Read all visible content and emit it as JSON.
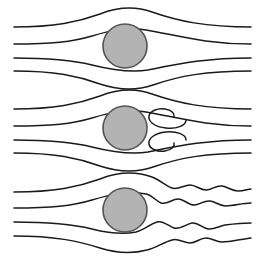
{
  "figure": {
    "background_color": "#ffffff",
    "width": 265,
    "height": 256
  },
  "style": {
    "streamline_color": "#1a1a1a",
    "streamline_width": 1.5,
    "cylinder_fill": "#b3b3b3",
    "cylinder_stroke": "#545454",
    "cylinder_stroke_width": 1.6
  },
  "panels": [
    {
      "id": "panel-laminar",
      "name": "laminar-attached-flow",
      "caption": "",
      "index": 1,
      "y_offset": 0,
      "cylinder": {
        "cx": 125,
        "cy": 46,
        "r": 22
      },
      "streamline_count": 4,
      "inlet_y": [
        27,
        44,
        58,
        71
      ],
      "outlet_y": [
        27,
        44,
        58,
        71
      ],
      "wake": "attached-symmetric",
      "paths": [
        "M 14,27 C 55,27 78,22 100,14 C 118,7 135,6 152,12 C 178,21 205,27 251,27",
        "M 14,44 C 52,44 72,42 92,36 C 112,30 128,27 146,30 C 176,35 205,44 251,44",
        "M 14,58 C 52,58 72,60 92,65 C 112,70 130,73 148,70 C 178,64 205,58 251,58",
        "M 14,71 C 55,71 78,76 100,84 C 118,90 136,91 153,85 C 179,76 205,71 251,71"
      ]
    },
    {
      "id": "panel-separated",
      "name": "steady-separated-twin-vortices",
      "caption": "",
      "index": 2,
      "y_offset": 85,
      "cylinder": {
        "cx": 125,
        "cy": 128,
        "r": 22
      },
      "streamline_count": 4,
      "inlet_y": [
        109,
        126,
        140,
        153
      ],
      "outlet_y": [
        109,
        126,
        140,
        153
      ],
      "wake": "two-counter-rotating-recirculation-bubbles",
      "vortices": [
        {
          "name": "upper-vortex",
          "cx": 166,
          "cy": 117,
          "rotation": "clockwise"
        },
        {
          "name": "lower-vortex",
          "cx": 166,
          "cy": 143,
          "rotation": "counter-clockwise"
        }
      ],
      "paths": [
        "M 14,109 C 55,109 78,104 100,96 C 118,89 135,88 152,94 C 178,103 205,109 251,109",
        "M 14,126 C 52,126 72,124 92,118 C 112,112 128,109 146,112 C 176,117 205,126 251,126",
        "M 14,140 C 52,140 72,142 92,147 C 112,152 130,155 148,152 C 178,146 205,140 251,140",
        "M 14,153 C 55,153 78,158 100,166 C 118,172 136,173 153,167 C 179,158 205,153 251,153"
      ],
      "vortex_paths": [
        "M 186,120 C 186,126 176,129 166,128 C 154,127 148,121 149,116 C 150,111 157,108 165,109 C 172,110 175,114 174,117",
        "M 186,140 C 186,134 176,131 166,132 C 154,133 148,139 149,144 C 150,149 157,152 165,151 C 172,150 175,146 174,143"
      ]
    },
    {
      "id": "panel-turbulent",
      "name": "turbulent-unsteady-wake",
      "caption": "",
      "index": 3,
      "y_offset": 170,
      "cylinder": {
        "cx": 125,
        "cy": 210,
        "r": 22
      },
      "streamline_count": 4,
      "inlet_y": [
        192,
        208,
        222,
        236
      ],
      "outlet_y": [
        196,
        209,
        222,
        234
      ],
      "wake": "wavy-fluctuating-turbulent-streaklines",
      "paths": [
        "M 14,192 C 55,192 78,187 100,179 C 118,172 135,171 152,177 C 160,180 166,186 172,188 C 178,190 184,185 190,185 C 196,185 200,190 206,190 C 212,190 216,185 222,186 C 228,187 232,191 238,191 C 244,191 248,189 251,189",
        "M 14,208 C 52,208 72,206 92,200 C 112,194 128,191 146,194 C 152,195 156,201 161,203 C 167,205 172,199 178,199 C 184,199 188,205 194,205 C 200,205 204,200 210,201 C 216,202 220,206 226,206 C 234,206 242,203 251,203",
        "M 14,222 C 52,222 72,224 92,229 C 108,233 122,235 136,232 C 144,230 150,224 157,222 C 163,220 168,226 174,228 C 180,230 186,224 192,223 C 198,222 202,228 208,229 C 214,230 219,226 225,225 C 233,224 242,223 251,223",
        "M 14,236 C 55,236 78,241 100,248 C 116,253 132,254 147,250 C 156,248 164,242 172,240 C 178,238 184,243 190,243 C 196,243 200,238 206,238 C 212,238 216,242 222,242 C 230,242 242,239 251,238"
      ]
    }
  ]
}
